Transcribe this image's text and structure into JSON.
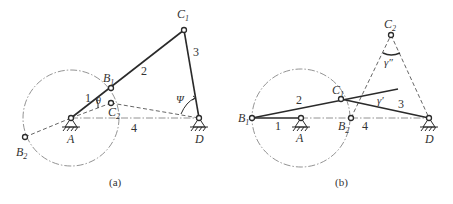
{
  "figure_a": {
    "caption": "(a)",
    "labels": {
      "B1": "B",
      "B1_sub": "1",
      "C1": "C",
      "C1_sub": "1",
      "C2": "C",
      "C2_sub": "2",
      "B2": "B",
      "B2_sub": "2",
      "A": "A",
      "D": "D",
      "link1": "1",
      "link2": "2",
      "link3": "3",
      "link4": "4",
      "theta": "θ",
      "psi": "Ψ"
    }
  },
  "figure_b": {
    "caption": "(b)",
    "labels": {
      "B1": "B",
      "B1_sub": "1",
      "B2": "B",
      "B2_sub": "2",
      "C1": "C",
      "C1_sub": "1",
      "C2": "C",
      "C2_sub": "2",
      "A": "A",
      "D": "D",
      "link1": "1",
      "link2": "2",
      "link3": "3",
      "link4": "4",
      "gamma1": "γ′",
      "gamma2": "γ″"
    }
  }
}
